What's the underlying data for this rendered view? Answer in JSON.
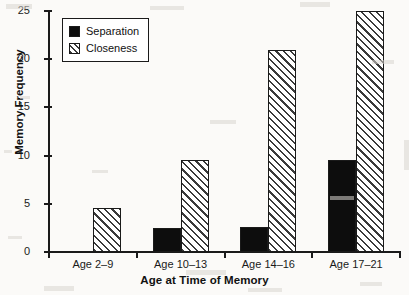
{
  "chart_data": {
    "type": "bar",
    "title": "",
    "xlabel": "Age at Time of Memory",
    "ylabel": "Memory Frequency",
    "categories": [
      "Age 2–9",
      "Age 10–13",
      "Age 14–16",
      "Age 17–21"
    ],
    "series": [
      {
        "name": "Separation",
        "values": [
          0,
          2.5,
          2.6,
          9.5
        ],
        "fill": "solid-black",
        "color": "#0d0d0d"
      },
      {
        "name": "Closeness",
        "values": [
          4.6,
          9.5,
          21,
          25
        ],
        "fill": "diagonal-hatch",
        "color": "#3a3a3a"
      }
    ],
    "ylim": [
      0,
      25
    ],
    "yticks": [
      0,
      5,
      10,
      15,
      20,
      25
    ],
    "ytick_labels": [
      "0",
      "5",
      "10",
      "15",
      "20",
      "25"
    ],
    "grid": false,
    "legend_position": "top-left"
  },
  "legend": {
    "entries": [
      {
        "label": "Separation"
      },
      {
        "label": "Closeness"
      }
    ]
  }
}
